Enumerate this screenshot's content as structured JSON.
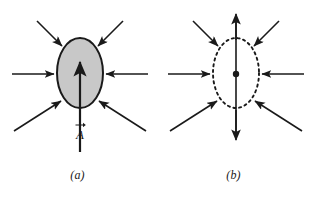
{
  "figure": {
    "width": 311,
    "height": 198,
    "background_color": "#ffffff",
    "ink_color": "#1a1a1a",
    "body_fill_color": "#c8c8c8"
  },
  "panels": [
    {
      "id": "a",
      "caption": "(a)",
      "body": {
        "shape": "ellipse",
        "style": "solid-outline-filled",
        "center_x": 80,
        "center_y": 73,
        "radius_x": 23,
        "radius_y": 35
      },
      "inward_arrows": 6,
      "labels": [
        {
          "name": "area-vector-label",
          "symbol": "A",
          "accent": "vector-arrow",
          "prime": "",
          "subscript": "",
          "text": "A"
        }
      ],
      "center_dot": false,
      "vertical_arrows": [
        {
          "name": "up-arrow-A",
          "direction": "up"
        }
      ]
    },
    {
      "id": "b",
      "caption": "(b)",
      "body": {
        "shape": "ellipse",
        "style": "dashed-outline-unfilled",
        "center_x": 236,
        "center_y": 73,
        "radius_x": 23,
        "radius_y": 35
      },
      "inward_arrows": 6,
      "labels": [
        {
          "name": "area-vector-prime-label",
          "symbol": "A",
          "accent": "vector-arrow",
          "prime": "′",
          "subscript": "",
          "text": "A′"
        },
        {
          "name": "weight-vector-label",
          "symbol": "W",
          "accent": "vector-arrow",
          "prime": "",
          "subscript": "d",
          "text": "Wd"
        }
      ],
      "center_dot": true,
      "vertical_arrows": [
        {
          "name": "up-arrow-A-prime",
          "direction": "up"
        },
        {
          "name": "down-arrow-Wd",
          "direction": "down"
        }
      ]
    }
  ]
}
